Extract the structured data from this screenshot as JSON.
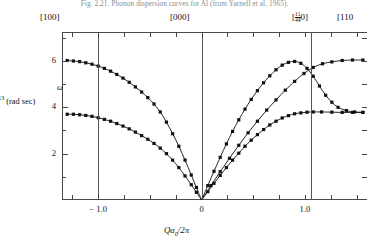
{
  "caption": "Fig. 2.21. Phonon dispersion curves for Al (from Yarnell et al. 1965).",
  "direction_labels": [
    {
      "name": "dir-100",
      "text": "[100]",
      "x": 40,
      "y": 12
    },
    {
      "name": "dir-000",
      "text": "[000]",
      "x": 170,
      "y": 12
    },
    {
      "name": "dir-half-half-0",
      "text": "[",
      "frac_num": "1",
      "frac_den": "4",
      "frac2_num": "1",
      "frac2_den": "4",
      "tail": "0]",
      "x": 292,
      "y": 12
    },
    {
      "name": "dir-110",
      "text": "[110",
      "x": 337,
      "y": 12
    }
  ],
  "axes": {
    "ylabel": "0",
    "ylabel_sup": "13",
    "ylabel_tail": " (rad sec)",
    "omega_symbol": "ω",
    "xtitle_q": "Qa",
    "xtitle_sub": "0",
    "xtitle_rest": "/2π",
    "y_ticks": [
      {
        "value": 2,
        "label": "2"
      },
      {
        "value": 4,
        "label": "4"
      },
      {
        "value": 6,
        "label": "6"
      }
    ],
    "y_minor": [
      1,
      3,
      5,
      7
    ],
    "ylim": [
      0,
      7.25
    ],
    "x_ticks": [
      {
        "value": -1.0,
        "label": "− 1.0"
      },
      {
        "value": 0.0,
        "label": "0"
      },
      {
        "value": 1.0,
        "label": "1.0"
      }
    ],
    "x_minor": [
      -1.25,
      -0.75,
      -0.5,
      -0.25,
      0.25,
      0.5,
      0.75,
      1.25,
      1.5
    ],
    "xlim": [
      -1.35,
      1.6
    ],
    "zone_lines": [
      -1.0,
      0.0,
      1.06
    ]
  },
  "chart_data": {
    "type": "line",
    "title": "Phonon dispersion curves for Al",
    "xlabel": "Qa0/2π",
    "ylabel": "ω / 10^13 (rad sec)",
    "xlim": [
      -1.35,
      1.6
    ],
    "ylim": [
      0,
      7.25
    ],
    "grid": false,
    "legend": "none",
    "marker": "filled-square",
    "series": [
      {
        "name": "[100] LA",
        "points": [
          [
            -1.3,
            6.02
          ],
          [
            -1.24,
            6.0
          ],
          [
            -1.18,
            5.97
          ],
          [
            -1.12,
            5.92
          ],
          [
            -1.06,
            5.86
          ],
          [
            -1.0,
            5.78
          ],
          [
            -0.94,
            5.68
          ],
          [
            -0.88,
            5.56
          ],
          [
            -0.82,
            5.42
          ],
          [
            -0.76,
            5.26
          ],
          [
            -0.7,
            5.08
          ],
          [
            -0.64,
            4.88
          ],
          [
            -0.58,
            4.66
          ],
          [
            -0.52,
            4.42
          ],
          [
            -0.46,
            4.14
          ],
          [
            -0.4,
            3.8
          ],
          [
            -0.34,
            3.36
          ],
          [
            -0.28,
            2.86
          ],
          [
            -0.22,
            2.32
          ],
          [
            -0.16,
            1.72
          ],
          [
            -0.1,
            1.08
          ],
          [
            -0.05,
            0.54
          ],
          [
            0.0,
            0.0
          ]
        ]
      },
      {
        "name": "[100] TA",
        "points": [
          [
            -1.3,
            3.7
          ],
          [
            -1.24,
            3.7
          ],
          [
            -1.18,
            3.68
          ],
          [
            -1.12,
            3.65
          ],
          [
            -1.06,
            3.61
          ],
          [
            -1.0,
            3.55
          ],
          [
            -0.94,
            3.48
          ],
          [
            -0.88,
            3.4
          ],
          [
            -0.82,
            3.3
          ],
          [
            -0.76,
            3.19
          ],
          [
            -0.7,
            3.07
          ],
          [
            -0.64,
            2.93
          ],
          [
            -0.58,
            2.78
          ],
          [
            -0.52,
            2.62
          ],
          [
            -0.46,
            2.44
          ],
          [
            -0.4,
            2.24
          ],
          [
            -0.34,
            2.0
          ],
          [
            -0.28,
            1.72
          ],
          [
            -0.22,
            1.4
          ],
          [
            -0.16,
            1.04
          ],
          [
            -0.1,
            0.66
          ],
          [
            -0.05,
            0.33
          ],
          [
            0.0,
            0.0
          ]
        ]
      },
      {
        "name": "[110] LA",
        "points": [
          [
            0.0,
            0.0
          ],
          [
            0.06,
            0.62
          ],
          [
            0.12,
            1.24
          ],
          [
            0.18,
            1.84
          ],
          [
            0.24,
            2.42
          ],
          [
            0.3,
            2.96
          ],
          [
            0.36,
            3.46
          ],
          [
            0.42,
            3.92
          ],
          [
            0.48,
            4.34
          ],
          [
            0.54,
            4.72
          ],
          [
            0.6,
            5.06
          ],
          [
            0.66,
            5.36
          ],
          [
            0.72,
            5.62
          ],
          [
            0.78,
            5.82
          ],
          [
            0.84,
            5.94
          ],
          [
            0.9,
            5.98
          ],
          [
            0.96,
            5.9
          ],
          [
            1.02,
            5.68
          ],
          [
            1.08,
            5.34
          ],
          [
            1.14,
            4.92
          ],
          [
            1.2,
            4.52
          ],
          [
            1.26,
            4.22
          ],
          [
            1.32,
            4.0
          ],
          [
            1.4,
            3.86
          ],
          [
            1.48,
            3.8
          ],
          [
            1.56,
            3.78
          ]
        ]
      },
      {
        "name": "[110] TA1",
        "points": [
          [
            0.0,
            0.0
          ],
          [
            0.06,
            0.36
          ],
          [
            0.12,
            0.72
          ],
          [
            0.18,
            1.06
          ],
          [
            0.24,
            1.4
          ],
          [
            0.3,
            1.72
          ],
          [
            0.36,
            2.02
          ],
          [
            0.42,
            2.32
          ],
          [
            0.48,
            2.58
          ],
          [
            0.54,
            2.82
          ],
          [
            0.6,
            3.04
          ],
          [
            0.66,
            3.24
          ],
          [
            0.72,
            3.4
          ],
          [
            0.78,
            3.54
          ],
          [
            0.84,
            3.64
          ],
          [
            0.9,
            3.72
          ],
          [
            0.96,
            3.76
          ],
          [
            1.02,
            3.79
          ],
          [
            1.08,
            3.8
          ],
          [
            1.16,
            3.8
          ],
          [
            1.26,
            3.79
          ],
          [
            1.36,
            3.78
          ],
          [
            1.46,
            3.78
          ],
          [
            1.56,
            3.78
          ]
        ]
      },
      {
        "name": "[110] TA2",
        "points": [
          [
            0.0,
            0.0
          ],
          [
            0.09,
            0.62
          ],
          [
            0.18,
            1.22
          ],
          [
            0.27,
            1.8
          ],
          [
            0.36,
            2.36
          ],
          [
            0.45,
            2.9
          ],
          [
            0.54,
            3.4
          ],
          [
            0.63,
            3.88
          ],
          [
            0.72,
            4.32
          ],
          [
            0.81,
            4.74
          ],
          [
            0.9,
            5.12
          ],
          [
            0.99,
            5.46
          ],
          [
            1.08,
            5.72
          ],
          [
            1.17,
            5.88
          ],
          [
            1.26,
            5.96
          ],
          [
            1.36,
            6.02
          ],
          [
            1.46,
            6.04
          ],
          [
            1.56,
            6.04
          ]
        ]
      }
    ]
  }
}
